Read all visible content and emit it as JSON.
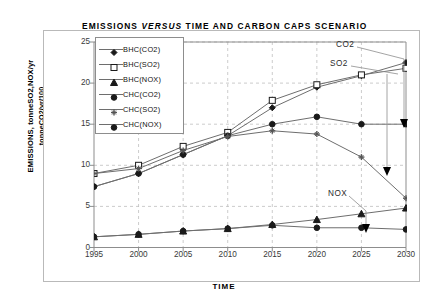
{
  "figure": {
    "title_part1": "EMISSIONS ",
    "title_italic": "VERSUS",
    "title_part2": " TIME AND CARBON CAPS SCENARIO",
    "title_full": "EMISSIONS VERSUS TIME AND CARBON CAPS SCENARIO",
    "ylabel_line1": "EMISSIONS, tonneSO2,NOX/yr",
    "ylabel_line2": "tonneCO2/yr/100",
    "xlabel": "TIME",
    "background_color": "#ffffff",
    "frame_color": "#b9b9b9",
    "grid_color": "#bfbfbf",
    "line_color": "#6e6e6e",
    "text_color": "#000000"
  },
  "legend": {
    "position": "inside-top-left",
    "entries": [
      {
        "label": "BHC(CO2)",
        "marker": "diamond-filled"
      },
      {
        "label": "BHC(SO2)",
        "marker": "square-open"
      },
      {
        "label": "BHC(NOX)",
        "marker": "triangle-filled"
      },
      {
        "label": "CHC(CO2)",
        "marker": "circle-filled"
      },
      {
        "label": "CHC(SO2)",
        "marker": "asterisk"
      },
      {
        "label": "CHC(NOX)",
        "marker": "circle-filled"
      }
    ]
  },
  "annotations": [
    {
      "name": "co2-annotation",
      "text": "CO2",
      "x": 336,
      "y": 45
    },
    {
      "name": "so2-annotation",
      "text": "SO2",
      "x": 330,
      "y": 64
    },
    {
      "name": "nox-annotation",
      "text": "NOX",
      "x": 328,
      "y": 192
    }
  ],
  "chart_data": {
    "type": "line",
    "title": "EMISSIONS VERSUS TIME AND CARBON CAPS SCENARIO",
    "xlabel": "TIME",
    "ylabel": "EMISSIONS, tonneSO2,NOX/yr tonneCO2/yr/100",
    "x": [
      1995,
      2000,
      2005,
      2010,
      2015,
      2020,
      2025,
      2030
    ],
    "xtick_labels": [
      "1995",
      "2000",
      "2005",
      "2010",
      "2015",
      "2020",
      "2025",
      "2030"
    ],
    "ytick_labels": [
      "0",
      "5",
      "10",
      "15",
      "20",
      "25"
    ],
    "xlim": [
      1995,
      2030
    ],
    "ylim": [
      0,
      25
    ],
    "ytick_step": 5,
    "grid": true,
    "grid_style": "dashed",
    "legend_position": "upper left inside",
    "series": [
      {
        "name": "BHC(CO2)",
        "marker": "diamond-filled",
        "values": [
          7.4,
          9.0,
          11.3,
          13.6,
          17.0,
          19.5,
          20.9,
          22.5
        ]
      },
      {
        "name": "BHC(SO2)",
        "marker": "square-open",
        "values": [
          9.0,
          10.0,
          12.3,
          14.0,
          17.9,
          19.8,
          21.0,
          21.8
        ]
      },
      {
        "name": "BHC(NOX)",
        "marker": "triangle-filled",
        "values": [
          1.3,
          1.6,
          2.0,
          2.3,
          2.8,
          3.4,
          4.1,
          4.8
        ]
      },
      {
        "name": "CHC(CO2)",
        "marker": "circle-filled",
        "values": [
          7.4,
          9.0,
          11.3,
          13.6,
          15.0,
          15.9,
          15.0,
          15.0
        ]
      },
      {
        "name": "CHC(SO2)",
        "marker": "asterisk",
        "values": [
          9.0,
          9.6,
          11.8,
          13.5,
          14.2,
          13.8,
          11.0,
          6.0
        ]
      },
      {
        "name": "CHC(NOX)",
        "marker": "circle-filled",
        "values": [
          1.3,
          1.6,
          2.0,
          2.3,
          2.7,
          2.4,
          2.4,
          2.2
        ]
      }
    ]
  }
}
